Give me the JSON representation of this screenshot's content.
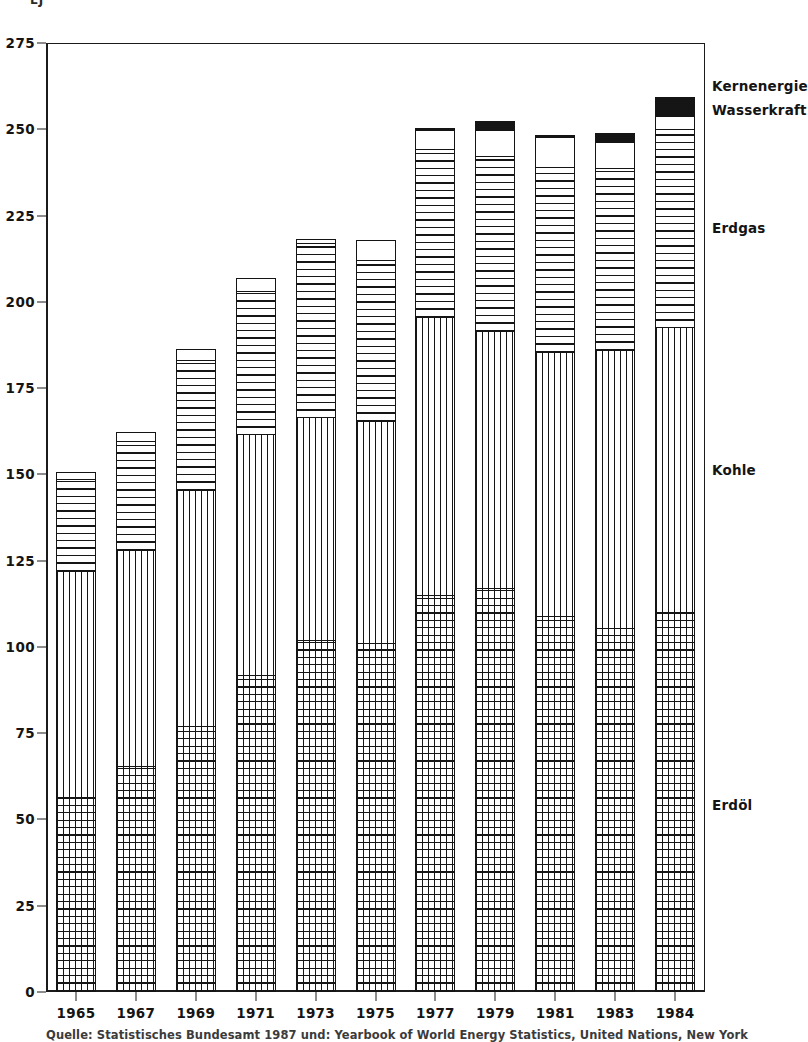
{
  "chart": {
    "unit_label": "EJ",
    "source_note": "Quelle: Statistisches Bundesamt 1987 und: Yearbook of World Energy Statistics, United Nations, New York"
  },
  "legend": [
    {
      "label": "Kernenergie",
      "pattern": "solid-black",
      "color": "#151515"
    },
    {
      "label": "Wasserkraft",
      "pattern": "plain-white",
      "color": "#ffffff"
    },
    {
      "label": "Erdgas",
      "pattern": "horizontal-lines",
      "color": "#151515"
    },
    {
      "label": "Kohle",
      "pattern": "vertical-lines",
      "color": "#151515"
    },
    {
      "label": "Erdöl",
      "pattern": "cross-hatch-grid",
      "color": "#151515"
    }
  ],
  "chart_data": {
    "type": "bar",
    "stacked": true,
    "title": "",
    "subtitle": "",
    "xlabel": "",
    "ylabel": "EJ",
    "ylim": [
      0,
      275
    ],
    "yticks": [
      0,
      25,
      50,
      75,
      100,
      125,
      150,
      175,
      200,
      225,
      250,
      275
    ],
    "grid": false,
    "legend_position": "right",
    "categories": [
      "1965",
      "1967",
      "1969",
      "1971",
      "1973",
      "1975",
      "1977",
      "1979",
      "1981",
      "1983",
      "1984"
    ],
    "series": [
      {
        "name": "Erdöl",
        "values": [
          56.5,
          65.5,
          77,
          92,
          102,
          101,
          115,
          117,
          109,
          105.5,
          110
        ]
      },
      {
        "name": "Kohle",
        "values": [
          66,
          63,
          69,
          70,
          65,
          65,
          81,
          75,
          77,
          81,
          83
        ]
      },
      {
        "name": "Erdgas",
        "values": [
          27,
          32,
          38,
          42,
          51,
          47,
          49,
          51,
          54,
          53,
          58
        ]
      },
      {
        "name": "Wasserkraft",
        "values": [
          2.5,
          3,
          3.5,
          4,
          1.5,
          6,
          6,
          8,
          9,
          8,
          4
        ]
      },
      {
        "name": "Kernenergie",
        "values": [
          0,
          0,
          0,
          0.5,
          0,
          0,
          1,
          3,
          1,
          3,
          6
        ]
      }
    ],
    "totals": [
      152,
      163.5,
      187.5,
      208.5,
      219.5,
      219,
      252,
      254,
      250,
      250.5,
      261
    ]
  }
}
